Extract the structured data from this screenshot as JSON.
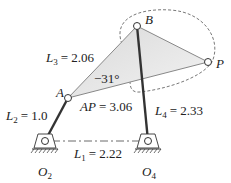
{
  "diagram": {
    "type": "four-bar linkage",
    "points": {
      "A": {
        "label": "A"
      },
      "B": {
        "label": "B"
      },
      "P": {
        "label": "P"
      },
      "O2": {
        "label": "O",
        "sub": "2"
      },
      "O4": {
        "label": "O",
        "sub": "4"
      }
    },
    "links": {
      "L1": {
        "name": "L",
        "sub": "1",
        "value": "= 2.22"
      },
      "L2": {
        "name": "L",
        "sub": "2",
        "value": "= 1.0"
      },
      "L3": {
        "name": "L",
        "sub": "3",
        "value": "= 2.06"
      },
      "L4": {
        "name": "L",
        "sub": "4",
        "value": "= 2.33"
      },
      "AP": {
        "name": "AP",
        "value": "= 3.06"
      }
    },
    "angle": "−31°",
    "colors": {
      "coupler_fill": "#e6e6e6",
      "link": "#333333",
      "ink": "#222222"
    }
  }
}
